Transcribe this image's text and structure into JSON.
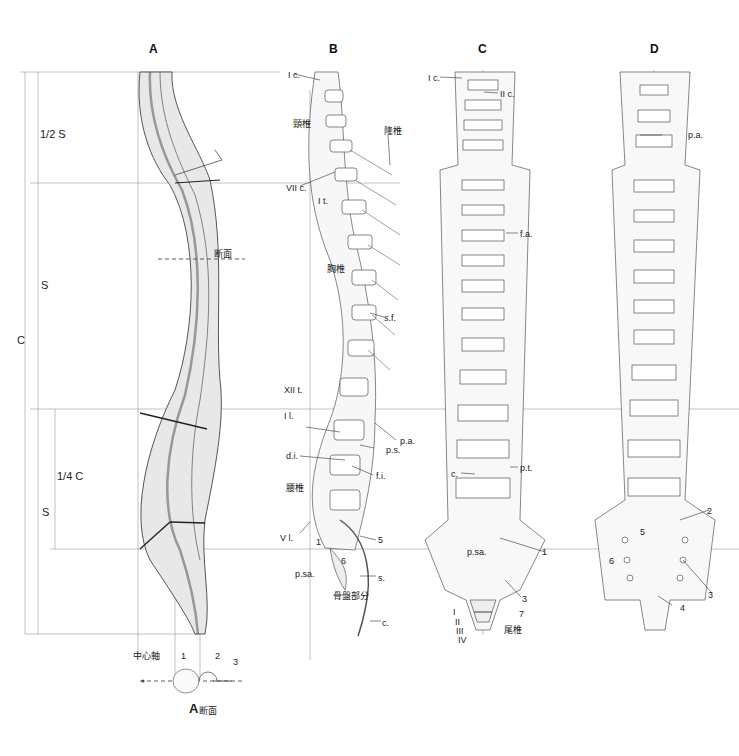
{
  "panels": {
    "A": {
      "title": "A",
      "measures": {
        "half_s": "1/2 S",
        "s_upper": "S",
        "c": "C",
        "quarter_c": "1/4 C",
        "s_lower": "S"
      },
      "section_label": "断面",
      "cross_section": {
        "title_letter": "A",
        "title_text": "断面",
        "center_axis": "中心軸",
        "n1": "1",
        "n2": "2",
        "n3": "3"
      }
    },
    "B": {
      "title": "B",
      "labels": {
        "ic": "I c.",
        "cervical": "頸椎",
        "prominens": "隆椎",
        "viic": "VII c.",
        "it": "I t.",
        "thoracic": "胸椎",
        "sf": "s.f.",
        "xiit": "XII t.",
        "il": "I l.",
        "pa": "p.a.",
        "di": "d.i.",
        "ps": "p.s.",
        "fi": "f.i.",
        "lumbar": "腰椎",
        "vl": "V l.",
        "n5": "5",
        "n1": "1",
        "n6": "6",
        "psa": "p.sa.",
        "s": "s.",
        "pelvic": "骨盤部分",
        "c": "c."
      }
    },
    "C": {
      "title": "C",
      "labels": {
        "ic": "I c.",
        "iic": "II c.",
        "fa": "f.a.",
        "c": "c.",
        "pt": "p.t.",
        "psa": "p.sa.",
        "n1": "1",
        "n3": "3",
        "n7": "7",
        "r1": "I",
        "r2": "II",
        "r3": "III",
        "r4": "IV",
        "coccyx": "尾椎"
      }
    },
    "D": {
      "title": "D",
      "labels": {
        "pa": "p.a.",
        "n2": "2",
        "n5": "5",
        "n6": "6",
        "n3": "3",
        "n4": "4"
      }
    }
  }
}
